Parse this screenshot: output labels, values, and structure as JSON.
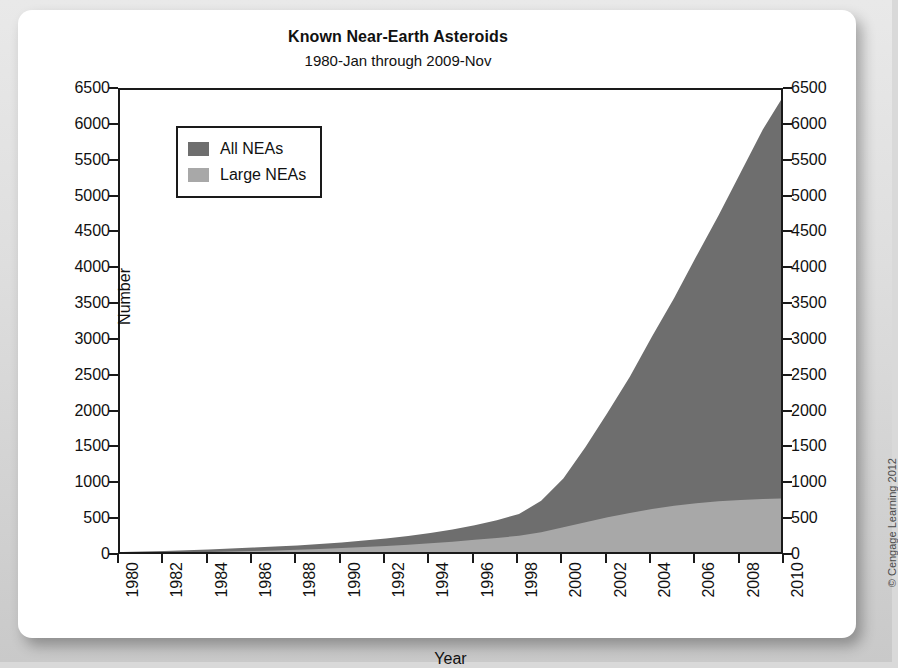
{
  "figure": {
    "credit": "© Cengage Learning 2012"
  },
  "chart_data": {
    "type": "area",
    "title": "Known Near-Earth Asteroids",
    "subtitle": "1980-Jan through 2009-Nov",
    "xlabel": "Year",
    "ylabel": "Number",
    "xlim": [
      1980,
      2010
    ],
    "ylim": [
      0,
      6500
    ],
    "grid": false,
    "stacked": true,
    "legend_position": "upper-left",
    "xticks": [
      1980,
      1982,
      1984,
      1986,
      1988,
      1990,
      1992,
      1994,
      1996,
      1998,
      2000,
      2002,
      2004,
      2006,
      2008,
      2010
    ],
    "yticks": [
      0,
      500,
      1000,
      1500,
      2000,
      2500,
      3000,
      3500,
      4000,
      4500,
      5000,
      5500,
      6000,
      6500
    ],
    "ytick_labels": [
      "0",
      "500",
      "1000",
      "1500",
      "2000",
      "2500",
      "3000",
      "3500",
      "4000",
      "4500",
      "5000",
      "5500",
      "6000",
      "6500"
    ],
    "xtick_labels": [
      "1980",
      "1982",
      "1984",
      "1986",
      "1988",
      "1990",
      "1992",
      "1994",
      "1996",
      "1998",
      "2000",
      "2002",
      "2004",
      "2006",
      "2008",
      "2010"
    ],
    "x": [
      1980,
      1981,
      1982,
      1983,
      1984,
      1985,
      1986,
      1987,
      1988,
      1989,
      1990,
      1991,
      1992,
      1993,
      1994,
      1995,
      1996,
      1997,
      1998,
      1999,
      2000,
      2001,
      2002,
      2003,
      2004,
      2005,
      2006,
      2007,
      2008,
      2009,
      2010
    ],
    "series": [
      {
        "name": "All NEAs",
        "color": "#6e6e6e",
        "values": [
          55,
          62,
          70,
          80,
          92,
          104,
          118,
          132,
          148,
          168,
          190,
          215,
          245,
          280,
          320,
          370,
          430,
          500,
          585,
          770,
          1080,
          1520,
          2000,
          2500,
          3060,
          3600,
          4180,
          4750,
          5350,
          5950,
          6450
        ]
      },
      {
        "name": "Large NEAs",
        "color": "#a8a8a8",
        "values": [
          38,
          42,
          46,
          51,
          57,
          63,
          70,
          78,
          87,
          97,
          110,
          124,
          140,
          158,
          178,
          200,
          225,
          252,
          282,
          330,
          400,
          470,
          540,
          600,
          655,
          700,
          735,
          762,
          782,
          795,
          805
        ]
      }
    ]
  },
  "legend": {
    "items": [
      {
        "label": "All NEAs",
        "color": "#6e6e6e"
      },
      {
        "label": "Large NEAs",
        "color": "#a8a8a8"
      }
    ]
  }
}
